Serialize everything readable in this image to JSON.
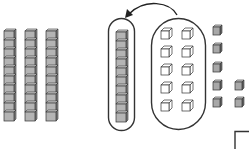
{
  "diagram": {
    "colors": {
      "cube_fill": "#b4b4b4",
      "cube_top": "#d8d8d8",
      "cube_side": "#8a8a8a",
      "outline": "#333333",
      "open_cube_fill": "#ffffff",
      "background": "#ffffff"
    },
    "tens_rods": {
      "count": 3,
      "cubes_per_rod": 10,
      "x_positions": [
        4,
        25,
        46
      ]
    },
    "circled_rod": {
      "cubes": 10
    },
    "circled_open_cubes": {
      "count": 10,
      "columns": 2,
      "rows": 5
    },
    "loose_ones": {
      "count": 7
    },
    "arrow": {
      "direction": "left",
      "from": "circled-open-cubes",
      "to": "circled-rod"
    }
  }
}
